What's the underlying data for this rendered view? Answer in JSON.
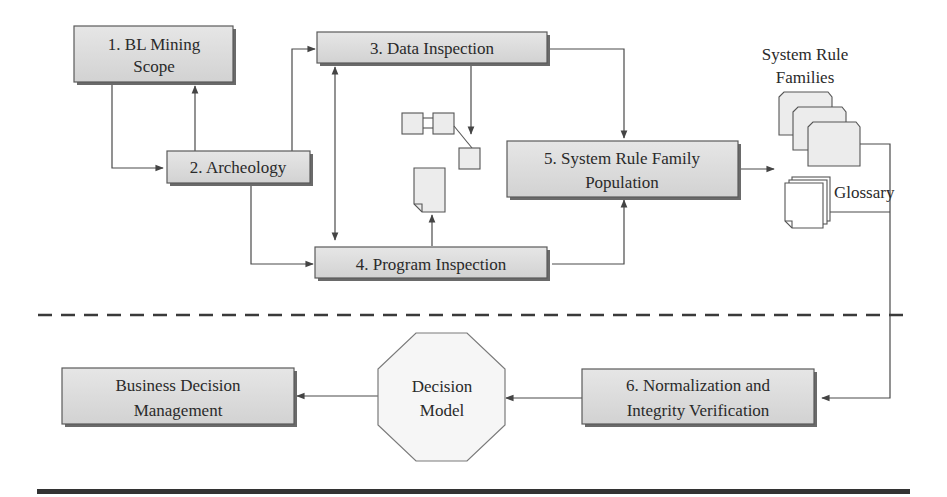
{
  "diagram": {
    "nodes": {
      "bl_mining_scope": {
        "line1": "1. BL Mining",
        "line2": "Scope"
      },
      "archeology": {
        "label": "2. Archeology"
      },
      "data_inspection": {
        "label": "3. Data Inspection"
      },
      "program_inspection": {
        "label": "4. Program Inspection"
      },
      "system_rule_family_population": {
        "line1": "5. System Rule Family",
        "line2": "Population"
      },
      "normalization": {
        "line1": "6. Normalization and",
        "line2": "Integrity Verification"
      },
      "decision_model": {
        "line1": "Decision",
        "line2": "Model"
      },
      "business_decision_management": {
        "line1": "Business Decision",
        "line2": "Management"
      }
    },
    "artifacts": {
      "system_rule_families": {
        "line1": "System Rule",
        "line2": "Families"
      },
      "glossary": {
        "label": "Glossary"
      }
    },
    "edges": [
      {
        "from": "1. BL Mining Scope",
        "to": "2. Archeology"
      },
      {
        "from": "2. Archeology",
        "to": "1. BL Mining Scope"
      },
      {
        "from": "2. Archeology",
        "to": "3. Data Inspection"
      },
      {
        "from": "2. Archeology",
        "to": "4. Program Inspection"
      },
      {
        "from": "3. Data Inspection",
        "to": "4. Program Inspection",
        "bidirectional": true
      },
      {
        "from": "3. Data Inspection",
        "to": "data-model-icon"
      },
      {
        "from": "4. Program Inspection",
        "to": "program-document-icon"
      },
      {
        "from": "3. Data Inspection",
        "to": "5. System Rule Family Population"
      },
      {
        "from": "4. Program Inspection",
        "to": "5. System Rule Family Population"
      },
      {
        "from": "5. System Rule Family Population",
        "to": "System Rule Families / Glossary"
      },
      {
        "from": "System Rule Families / Glossary",
        "to": "6. Normalization and Integrity Verification"
      },
      {
        "from": "6. Normalization and Integrity Verification",
        "to": "Decision Model"
      },
      {
        "from": "Decision Model",
        "to": "Business Decision Management"
      }
    ],
    "colors": {
      "box_fill": "#dcdcdc",
      "box_border": "#5a5a5a",
      "line": "#4a4a4a",
      "text": "#2a2a2a",
      "rule": "#333333"
    }
  }
}
